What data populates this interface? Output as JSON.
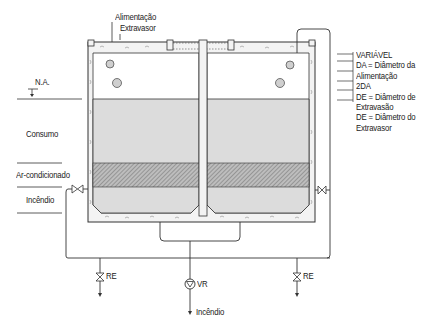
{
  "diagram": {
    "top_labels": {
      "feed": "Alimentação",
      "overflow": "Extravasor"
    },
    "left_labels": {
      "water_level": "N.A.",
      "consumption": "Consumo",
      "air_conditioning": "Ar-condicionado",
      "fire": "Incêndio"
    },
    "legend": [
      "VARIÁVEL",
      "DA = Diâmetro da",
      "Alimentação",
      "2DA",
      "DE = Diâmetro de",
      "Extravasão",
      "DE = Diâmetro do",
      "Extravasor"
    ],
    "valves": {
      "drain_left": "RE",
      "drain_right": "RE",
      "check_valve": "VR"
    },
    "outlet_label": "Incêndio",
    "colors": {
      "line": "#333333",
      "water": "#d9d9d9",
      "hatch": "#8c8c8c",
      "concrete": "#f2f2f2"
    }
  }
}
